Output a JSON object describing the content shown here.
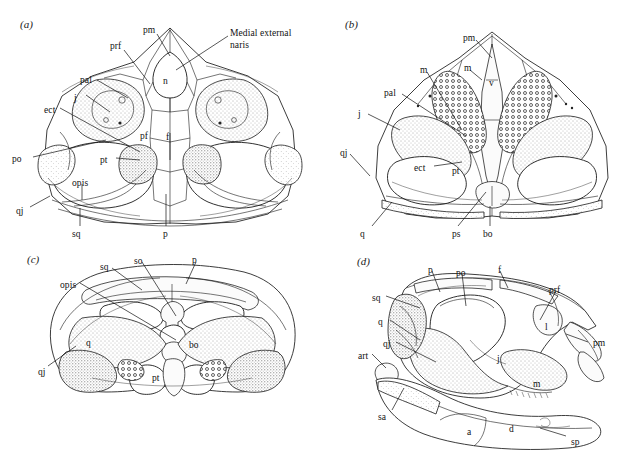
{
  "figure": {
    "background": "#ffffff",
    "ink": "#111111",
    "panels": [
      {
        "id": "a",
        "letter": "(a)",
        "view": "dorsal skull roof",
        "labels": [
          {
            "name": "pm",
            "text": "pm",
            "x": 143,
            "y": 25
          },
          {
            "name": "prf",
            "text": "prf",
            "x": 110,
            "y": 41
          },
          {
            "name": "naris",
            "text": "Medial external naris",
            "x": 230,
            "y": 28,
            "multiline": true
          },
          {
            "name": "n",
            "text": "n",
            "x": 163,
            "y": 76
          },
          {
            "name": "pal",
            "text": "pal",
            "x": 80,
            "y": 75
          },
          {
            "name": "i",
            "text": "j",
            "x": 74,
            "y": 93
          },
          {
            "name": "ect",
            "text": "ect",
            "x": 44,
            "y": 105
          },
          {
            "name": "pf",
            "text": "pf",
            "x": 140,
            "y": 131
          },
          {
            "name": "f",
            "text": "f",
            "x": 166,
            "y": 132
          },
          {
            "name": "po",
            "text": "po",
            "x": 12,
            "y": 154
          },
          {
            "name": "pt",
            "text": "pt",
            "x": 100,
            "y": 155
          },
          {
            "name": "opis",
            "text": "opis",
            "x": 72,
            "y": 178
          },
          {
            "name": "qj",
            "text": "qj",
            "x": 16,
            "y": 206
          },
          {
            "name": "sq",
            "text": "sq",
            "x": 72,
            "y": 229
          },
          {
            "name": "p",
            "text": "p",
            "x": 163,
            "y": 229
          }
        ]
      },
      {
        "id": "b",
        "letter": "(b)",
        "view": "palatal view",
        "labels": [
          {
            "name": "pm",
            "text": "pm",
            "x": 463,
            "y": 33
          },
          {
            "name": "m-left",
            "text": "m",
            "x": 420,
            "y": 65
          },
          {
            "name": "m-right",
            "text": "m",
            "x": 464,
            "y": 63
          },
          {
            "name": "v",
            "text": "v",
            "x": 489,
            "y": 78
          },
          {
            "name": "pal",
            "text": "pal",
            "x": 384,
            "y": 88
          },
          {
            "name": "i",
            "text": "j",
            "x": 358,
            "y": 109
          },
          {
            "name": "qj",
            "text": "qj",
            "x": 340,
            "y": 148
          },
          {
            "name": "ect",
            "text": "ect",
            "x": 414,
            "y": 163
          },
          {
            "name": "pt",
            "text": "pt",
            "x": 452,
            "y": 166
          },
          {
            "name": "q",
            "text": "q",
            "x": 360,
            "y": 229
          },
          {
            "name": "ps",
            "text": "ps",
            "x": 452,
            "y": 229
          },
          {
            "name": "bo",
            "text": "bo",
            "x": 483,
            "y": 229
          }
        ]
      },
      {
        "id": "c",
        "letter": "(c)",
        "view": "occipital view",
        "labels": [
          {
            "name": "sq",
            "text": "sq",
            "x": 100,
            "y": 262
          },
          {
            "name": "so",
            "text": "so",
            "x": 134,
            "y": 256
          },
          {
            "name": "p",
            "text": "p",
            "x": 192,
            "y": 255
          },
          {
            "name": "opis",
            "text": "opis",
            "x": 60,
            "y": 280
          },
          {
            "name": "q",
            "text": "q",
            "x": 86,
            "y": 338
          },
          {
            "name": "bo",
            "text": "bo",
            "x": 189,
            "y": 340
          },
          {
            "name": "qj",
            "text": "qj",
            "x": 38,
            "y": 367
          },
          {
            "name": "pt",
            "text": "pt",
            "x": 152,
            "y": 373
          }
        ]
      },
      {
        "id": "d",
        "letter": "(d)",
        "view": "lateral skull and lower jaw",
        "labels": [
          {
            "name": "p",
            "text": "p",
            "x": 428,
            "y": 265
          },
          {
            "name": "po",
            "text": "po",
            "x": 456,
            "y": 268
          },
          {
            "name": "f",
            "text": "f",
            "x": 498,
            "y": 265
          },
          {
            "name": "prf",
            "text": "prf",
            "x": 549,
            "y": 285
          },
          {
            "name": "sq",
            "text": "sq",
            "x": 372,
            "y": 293
          },
          {
            "name": "q",
            "text": "q",
            "x": 378,
            "y": 317
          },
          {
            "name": "l",
            "text": "l",
            "x": 545,
            "y": 322
          },
          {
            "name": "qj",
            "text": "qj",
            "x": 383,
            "y": 339
          },
          {
            "name": "pm",
            "text": "pm",
            "x": 593,
            "y": 338
          },
          {
            "name": "art",
            "text": "art",
            "x": 358,
            "y": 351
          },
          {
            "name": "i",
            "text": "j",
            "x": 497,
            "y": 354
          },
          {
            "name": "m",
            "text": "m",
            "x": 533,
            "y": 379
          },
          {
            "name": "sa",
            "text": "sa",
            "x": 378,
            "y": 412
          },
          {
            "name": "a",
            "text": "a",
            "x": 467,
            "y": 427
          },
          {
            "name": "d",
            "text": "d",
            "x": 509,
            "y": 424
          },
          {
            "name": "sp",
            "text": "sp",
            "x": 571,
            "y": 437
          }
        ]
      }
    ]
  }
}
